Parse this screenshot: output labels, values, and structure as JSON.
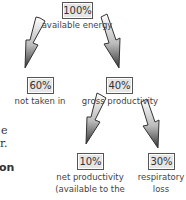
{
  "diagram": {
    "nodes": [
      {
        "id": "available",
        "value": "100%",
        "label": "available energy"
      },
      {
        "id": "not_taken",
        "value": "60%",
        "label": "not taken in"
      },
      {
        "id": "gross",
        "value": "40%",
        "label": "gross productivity"
      },
      {
        "id": "net",
        "value": "10%",
        "label_line1": "net productivity",
        "label_line2": "(available to the"
      },
      {
        "id": "resp",
        "value": "30%",
        "label_line1": "respiratory",
        "label_line2": "loss"
      }
    ],
    "edges": [
      {
        "from": "available",
        "to": "not_taken"
      },
      {
        "from": "available",
        "to": "gross"
      },
      {
        "from": "gross",
        "to": "net"
      },
      {
        "from": "gross",
        "to": "resp"
      }
    ],
    "side_text": {
      "line1": "e",
      "line2": "r.",
      "line3": "on"
    }
  }
}
